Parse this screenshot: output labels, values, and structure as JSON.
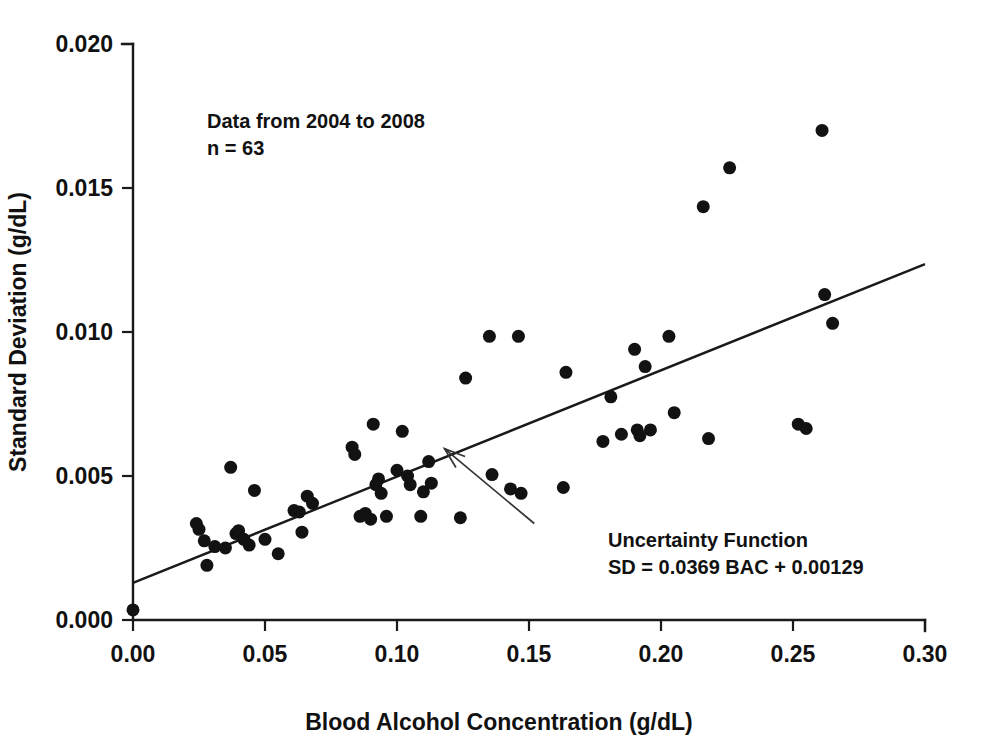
{
  "figure": {
    "background_color": "#ffffff",
    "ink_color": "#121212"
  },
  "chart_data": {
    "type": "scatter",
    "title": "",
    "xlabel": "Blood Alcohol Concentration (g/dL)",
    "ylabel": "Standard Deviation (g/dL)",
    "xlim": [
      0.0,
      0.3
    ],
    "ylim": [
      0.0,
      0.02
    ],
    "xticks": [
      0.0,
      0.05,
      0.1,
      0.15,
      0.2,
      0.25,
      0.3
    ],
    "xtick_labels": [
      "0.00",
      "0.05",
      "0.10",
      "0.15",
      "0.20",
      "0.25",
      "0.30"
    ],
    "yticks": [
      0.0,
      0.005,
      0.01,
      0.015,
      0.02
    ],
    "ytick_labels": [
      "0.000",
      "0.005",
      "0.010",
      "0.015",
      "0.020"
    ],
    "grid": false,
    "legend": null,
    "marker": "filled-circle",
    "marker_color": "#121212",
    "marker_size_px": 13,
    "series": [
      {
        "name": "Standard deviation vs BAC",
        "x": [
          0.0,
          0.024,
          0.025,
          0.027,
          0.028,
          0.031,
          0.035,
          0.037,
          0.039,
          0.04,
          0.042,
          0.044,
          0.046,
          0.05,
          0.055,
          0.061,
          0.063,
          0.064,
          0.066,
          0.068,
          0.083,
          0.084,
          0.086,
          0.088,
          0.09,
          0.091,
          0.092,
          0.093,
          0.094,
          0.096,
          0.1,
          0.102,
          0.104,
          0.105,
          0.109,
          0.11,
          0.112,
          0.113,
          0.124,
          0.126,
          0.135,
          0.136,
          0.143,
          0.146,
          0.147,
          0.163,
          0.164,
          0.178,
          0.181,
          0.185,
          0.19,
          0.191,
          0.192,
          0.194,
          0.196,
          0.203,
          0.205,
          0.216,
          0.218,
          0.226,
          0.252,
          0.255,
          0.261,
          0.262,
          0.265
        ],
        "y": [
          0.00035,
          0.00335,
          0.00315,
          0.00275,
          0.0019,
          0.00255,
          0.0025,
          0.0053,
          0.003,
          0.0031,
          0.0028,
          0.0026,
          0.0045,
          0.0028,
          0.0023,
          0.0038,
          0.00375,
          0.00305,
          0.0043,
          0.00405,
          0.006,
          0.00575,
          0.0036,
          0.0037,
          0.0035,
          0.0068,
          0.0047,
          0.0049,
          0.0044,
          0.0036,
          0.0052,
          0.00655,
          0.005,
          0.0047,
          0.0036,
          0.00445,
          0.0055,
          0.00475,
          0.00355,
          0.0084,
          0.00985,
          0.00505,
          0.00455,
          0.00985,
          0.0044,
          0.0046,
          0.0086,
          0.0062,
          0.00775,
          0.00645,
          0.0094,
          0.0066,
          0.0064,
          0.0088,
          0.0066,
          0.00985,
          0.0072,
          0.01435,
          0.0063,
          0.0157,
          0.0068,
          0.00665,
          0.017,
          0.0113,
          0.0103
        ]
      }
    ],
    "fit_line": {
      "label": "Uncertainty Function",
      "equation": "SD = 0.0369 BAC + 0.00129",
      "slope": 0.0369,
      "intercept": 0.00129,
      "x_start": 0.0,
      "x_end": 0.3
    },
    "annotations": [
      {
        "name": "data-range-note",
        "lines": [
          "Data from 2004 to 2008",
          "n = 63"
        ],
        "x": 0.021,
        "y": 0.0172
      },
      {
        "name": "fit-line-callout",
        "lines": [
          "Uncertainty Function",
          "SD = 0.0369 BAC + 0.00129"
        ],
        "x": 0.152,
        "y": 0.00335,
        "arrow_from": [
          0.152,
          0.00335
        ],
        "arrow_to": [
          0.118,
          0.00595
        ]
      }
    ]
  }
}
